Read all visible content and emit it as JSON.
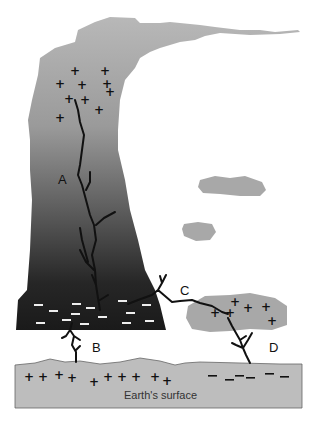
{
  "diagram": {
    "labels": {
      "a": "A",
      "b": "B",
      "c": "C",
      "d": "D",
      "surface": "Earth's surface"
    },
    "charges": {
      "plus": "+",
      "minus": "–"
    },
    "colors": {
      "cloud_top": "#b4b4b4",
      "cloud_bottom": "#1e1e1e",
      "small_cloud": "#a8a8a8",
      "ground": "#bdbdbd",
      "bolt": "#111111"
    }
  }
}
